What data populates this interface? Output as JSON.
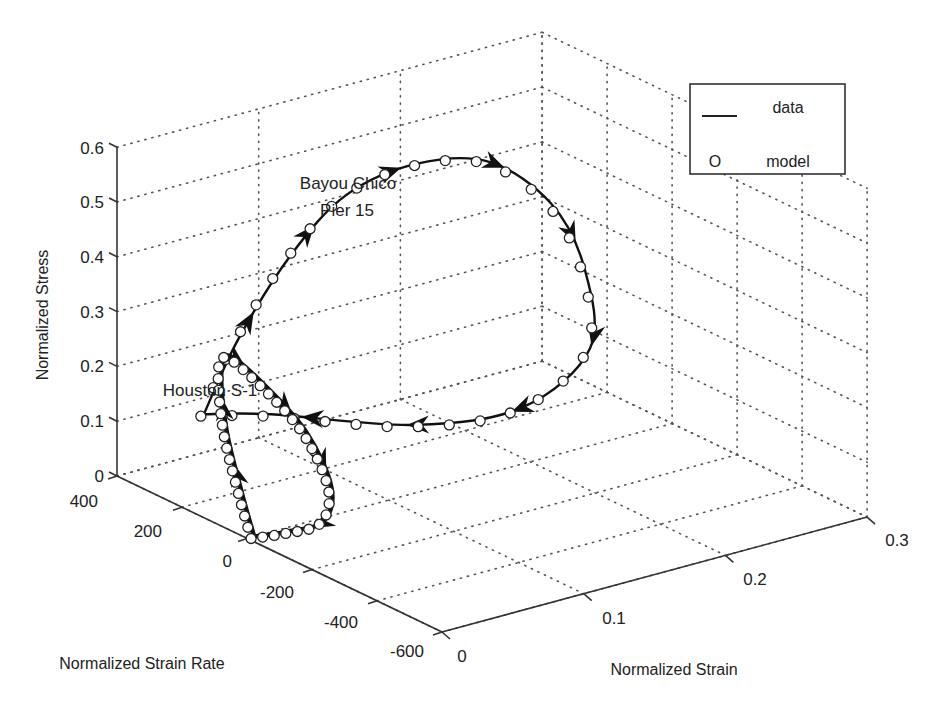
{
  "chart_data": {
    "type": "line3d",
    "title": "",
    "axes": {
      "x": {
        "label": "Normalized Strain",
        "ticks": [
          "0",
          "0.1",
          "0.2",
          "0.3"
        ],
        "range": [
          0,
          0.3
        ]
      },
      "y": {
        "label": "Normalized Strain Rate",
        "ticks": [
          "400",
          "200",
          "0",
          "-200",
          "-400",
          "-600"
        ],
        "range": [
          -600,
          400
        ]
      },
      "z": {
        "label": "Normalized Stress",
        "ticks": [
          "0",
          "0.1",
          "0.2",
          "0.3",
          "0.4",
          "0.5",
          "0.6"
        ],
        "range": [
          0,
          0.6
        ]
      }
    },
    "grid": true,
    "legend": {
      "position": "top-right",
      "entries": [
        {
          "symbol": "line",
          "label": "data"
        },
        {
          "symbol": "O",
          "label": "model"
        }
      ]
    },
    "annotations": [
      {
        "text": "Bayou Chico",
        "line2": "Pier 15"
      },
      {
        "text": "Houston S-1"
      }
    ],
    "series": [
      {
        "name": "Bayou Chico Pier 15",
        "style": "data line with arrows + model circles",
        "points_strain_rate_stress": [
          [
            0.02,
            220,
            0.15
          ],
          [
            0.04,
            200,
            0.28
          ],
          [
            0.07,
            170,
            0.42
          ],
          [
            0.1,
            130,
            0.52
          ],
          [
            0.14,
            90,
            0.56
          ],
          [
            0.18,
            40,
            0.55
          ],
          [
            0.21,
            -20,
            0.47
          ],
          [
            0.22,
            -80,
            0.36
          ],
          [
            0.21,
            -140,
            0.24
          ],
          [
            0.16,
            -150,
            0.17
          ],
          [
            0.1,
            -80,
            0.16
          ],
          [
            0.04,
            100,
            0.17
          ],
          [
            0.02,
            220,
            0.15
          ]
        ]
      },
      {
        "name": "Houston S-1",
        "style": "data line with arrows + model circles",
        "points_strain_rate_stress": [
          [
            0.005,
            0,
            0.0
          ],
          [
            0.01,
            60,
            0.06
          ],
          [
            0.02,
            150,
            0.14
          ],
          [
            0.03,
            210,
            0.22
          ],
          [
            0.04,
            230,
            0.24
          ],
          [
            0.05,
            170,
            0.2
          ],
          [
            0.06,
            80,
            0.13
          ],
          [
            0.055,
            -20,
            0.06
          ],
          [
            0.04,
            -60,
            0.02
          ],
          [
            0.02,
            -40,
            0.01
          ],
          [
            0.005,
            0,
            0.0
          ]
        ]
      }
    ]
  },
  "labels": {
    "zlabel": "Normalized Stress",
    "ylabel": "Normalized Strain Rate",
    "xlabel": "Normalized Strain",
    "anno_bayou_1": "Bayou Chico",
    "anno_bayou_2": "Pier 15",
    "anno_houston": "Houston S-1",
    "legend_data": "data",
    "legend_model_symbol": "O",
    "legend_model": "model",
    "z_ticks": [
      "0",
      "0.1",
      "0.2",
      "0.3",
      "0.4",
      "0.5",
      "0.6"
    ],
    "y_ticks": [
      "400",
      "200",
      "0",
      "-200",
      "-400",
      "-600"
    ],
    "x_ticks": [
      "0",
      "0.1",
      "0.2",
      "0.3"
    ]
  },
  "colors": {
    "background": "#ffffff",
    "ink": "#1a1a1a",
    "grid": "#555555"
  }
}
